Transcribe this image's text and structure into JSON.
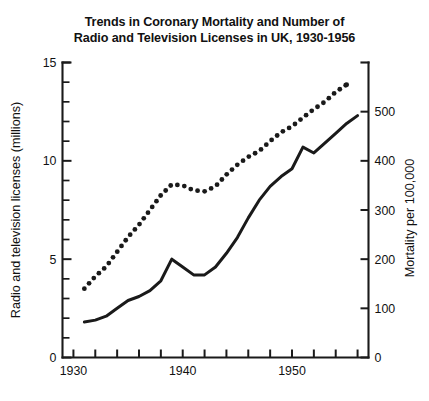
{
  "chart_data": {
    "type": "line",
    "title": "Trends in Coronary Mortality and Number of Radio and Television Licenses in UK, 1930-1956",
    "title_line1": "Trends in Coronary Mortality and Number of",
    "title_line2": "Radio and Television Licenses in UK, 1930-1956",
    "xlabel": "",
    "ylabel": "Radio and television licenses (millions)",
    "y2label": "Mortality per 100,000",
    "xlim": [
      1929,
      1957
    ],
    "ylim": [
      0,
      15
    ],
    "y2lim": [
      0,
      600
    ],
    "grid": false,
    "legend": "none",
    "xticks": [
      1930,
      1932,
      1934,
      1936,
      1938,
      1940,
      1942,
      1944,
      1946,
      1948,
      1950,
      1952,
      1954,
      1956
    ],
    "xticklabels": [
      "1930",
      "",
      "",
      "",
      "",
      "1940",
      "",
      "",
      "",
      "",
      "1950",
      "",
      "",
      ""
    ],
    "xticklabels_shown": [
      "1930",
      "1940",
      "1950"
    ],
    "yticks_major": [
      0,
      5,
      10,
      15
    ],
    "yticklabels_major": [
      "0",
      "5",
      "10",
      "15"
    ],
    "yticks_minor": [
      1,
      2,
      3,
      4,
      6,
      7,
      8,
      9,
      11,
      12,
      13,
      14
    ],
    "y2ticks": [
      0,
      100,
      200,
      300,
      400,
      500
    ],
    "y2ticklabels": [
      "0",
      "100",
      "200",
      "300",
      "400",
      "500"
    ],
    "series": [
      {
        "name": "Radio and television licenses (millions)",
        "style": "solid",
        "axis": "left",
        "color": "#1a1a1a",
        "x": [
          1931,
          1932,
          1933,
          1934,
          1935,
          1936,
          1937,
          1938,
          1939,
          1940,
          1941,
          1942,
          1943,
          1944,
          1945,
          1946,
          1947,
          1948,
          1949,
          1950,
          1951,
          1952,
          1953,
          1954,
          1955,
          1956
        ],
        "values": [
          1.8,
          1.9,
          2.1,
          2.5,
          2.9,
          3.1,
          3.4,
          3.9,
          5.0,
          4.6,
          4.2,
          4.2,
          4.6,
          5.3,
          6.1,
          7.1,
          8.0,
          8.7,
          9.2,
          9.6,
          10.7,
          10.4,
          10.9,
          11.4,
          11.9,
          12.3
        ]
      },
      {
        "name": "Coronary mortality per 100,000",
        "style": "dotted",
        "axis": "right",
        "color": "#1a1a1a",
        "x": [
          1931,
          1932,
          1933,
          1934,
          1935,
          1936,
          1937,
          1938,
          1939,
          1940,
          1941,
          1942,
          1943,
          1944,
          1945,
          1946,
          1947,
          1948,
          1949,
          1950,
          1951,
          1952,
          1953,
          1954,
          1955
        ],
        "values": [
          140,
          165,
          185,
          215,
          245,
          270,
          300,
          330,
          352,
          350,
          340,
          338,
          348,
          372,
          392,
          408,
          420,
          440,
          458,
          470,
          488,
          505,
          520,
          540,
          555
        ]
      }
    ]
  }
}
